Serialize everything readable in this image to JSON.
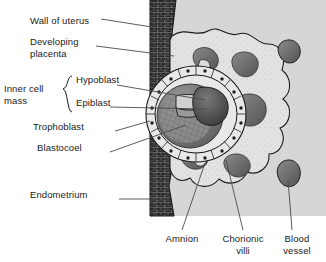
{
  "figure": {
    "kind": "biology-diagram",
    "cropped_caption_top": "x, xx x xxx, xxx xxx xxxxxxxxx",
    "colors": {
      "background_panel": "#d6d6d6",
      "page_background": "#ffffff",
      "uterine_wall": "#2a2a2a",
      "placenta_fill": "#e2e2e2",
      "lacuna_fill": "#6e6e6e",
      "blastocoel_fill": "#8a8a8a",
      "amniotic_cavity": "#5a5a5a",
      "leader_line": "#4a4a4a",
      "outline": "#1a1a1a",
      "text": "#1a1a1a"
    }
  },
  "labels": {
    "left": [
      {
        "id": "wall-of-uterus",
        "text": "Wall of uterus"
      },
      {
        "id": "developing-placenta",
        "line1": "Developing",
        "line2": "placenta"
      },
      {
        "id": "hypoblast",
        "text": "Hypoblast"
      },
      {
        "id": "epiblast",
        "text": "Epiblast"
      },
      {
        "id": "trophoblast",
        "text": "Trophoblast"
      },
      {
        "id": "blastocoel",
        "text": "Blastocoel"
      },
      {
        "id": "endometrium",
        "text": "Endometrium"
      }
    ],
    "bracket_group": {
      "id": "inner-cell-mass",
      "line1": "Inner cell",
      "line2": "mass"
    },
    "bottom": [
      {
        "id": "amnion",
        "line1": "Amnion",
        "line2": ""
      },
      {
        "id": "chorionic-villi",
        "line1": "Chorionic",
        "line2": "villi"
      },
      {
        "id": "blood-vessel",
        "line1": "Blood",
        "line2": "vessel"
      }
    ]
  }
}
